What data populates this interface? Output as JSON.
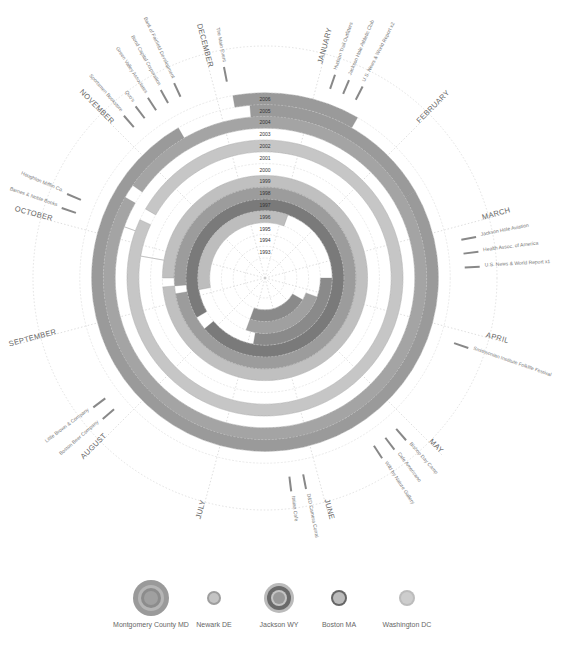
{
  "chart_data": {
    "type": "radial-timeline",
    "title": "",
    "center": [
      265,
      278
    ],
    "years": [
      "1993",
      "1994",
      "1995",
      "1996",
      "1997",
      "1998",
      "1999",
      "2000",
      "2001",
      "2002",
      "2003",
      "2004",
      "2005",
      "2006"
    ],
    "months": [
      "JANUARY",
      "FEBRUARY",
      "MARCH",
      "APRIL",
      "MAY",
      "JUNE",
      "JULY",
      "AUGUST",
      "SEPTEMBER",
      "OCTOBER",
      "NOVEMBER",
      "DECEMBER"
    ],
    "legend": [
      {
        "name": "Montgomery County MD",
        "color": "#9a9a9a"
      },
      {
        "name": "Newark DE",
        "color": "#b8b8b8"
      },
      {
        "name": "Jackson WY",
        "color": "#6e6e6e"
      },
      {
        "name": "Boston MA",
        "color": "#858585"
      },
      {
        "name": "Washington DC",
        "color": "#c6c6c6"
      }
    ],
    "employers": [
      {
        "month": "JANUARY",
        "labels": [
          "Hudson Trail Outfitters",
          "Jackson Hole Athletic Club",
          "U.S. News & World Report x2"
        ]
      },
      {
        "month": "MARCH",
        "labels": [
          "Jackson Hole Aviation",
          "Health Assoc. of America",
          "U.S. News & World Report x1"
        ]
      },
      {
        "month": "APRIL",
        "labels": [
          "Smithsonian Institute Folklife Festival"
        ]
      },
      {
        "month": "MAY",
        "labels": [
          "Bishop Day Camp",
          "Cafe Americano",
          "Wild by Nature Gallery"
        ]
      },
      {
        "month": "JUNE",
        "labels": [
          "D&D Camera Corral",
          "Italian Cafe"
        ]
      },
      {
        "month": "AUGUST",
        "labels": [
          "Boston Beer Company",
          "Little Brown & Company"
        ]
      },
      {
        "month": "OCTOBER",
        "labels": [
          "Barnes & Noble Books",
          "Houghton Mifflin Co."
        ]
      },
      {
        "month": "NOVEMBER",
        "labels": [
          "Sportsmen Bookstore",
          "Quo's",
          "Green Valley Associates",
          "Bond Capital Corporation",
          "Bank of Fairfield Development"
        ]
      },
      {
        "month": "DECEMBER",
        "labels": [
          "The Main Event"
        ]
      }
    ],
    "segments": [
      {
        "ring": 14,
        "start": -10,
        "end": 30,
        "color": "#9a9a9a"
      },
      {
        "ring": 13,
        "start": -5,
        "end": 60,
        "color": "#9a9a9a"
      },
      {
        "ring": 13,
        "start": 60,
        "end": 330,
        "color": "#9a9a9a"
      },
      {
        "ring": 12,
        "start": -55,
        "end": 300,
        "color": "#a4a4a4"
      },
      {
        "ring": 11,
        "start": -70,
        "end": 290,
        "color": "#b2b2b2"
      },
      {
        "ring": 10,
        "start": -60,
        "end": 295,
        "color": "#c6c6c6"
      },
      {
        "ring": 9,
        "start": -80,
        "end": 280,
        "color": "#b8b8b8"
      },
      {
        "ring": 8,
        "start": -80,
        "end": 280,
        "color": "#a8a8a8"
      },
      {
        "ring": 7,
        "start": -90,
        "end": 265,
        "color": "#c0c0c0"
      },
      {
        "ring": 6,
        "start": -95,
        "end": 260,
        "color": "#9c9c9c"
      },
      {
        "ring": 5,
        "start": -120,
        "end": 230,
        "color": "#7a7a7a"
      },
      {
        "ring": 4,
        "start": -100,
        "end": 20,
        "color": "#bdbdbd"
      },
      {
        "ring": 4,
        "start": 90,
        "end": 190,
        "color": "#8a8a8a"
      },
      {
        "ring": 3,
        "start": 110,
        "end": 200,
        "color": "#a0a0a0"
      },
      {
        "ring": 2,
        "start": 120,
        "end": 200,
        "color": "#8a8a8a"
      }
    ],
    "xlabel": "",
    "ylabel": ""
  },
  "legend_items": [
    {
      "label": "Montgomery County MD"
    },
    {
      "label": "Newark DE"
    },
    {
      "label": "Jackson WY"
    },
    {
      "label": "Boston MA"
    },
    {
      "label": "Washington DC"
    }
  ]
}
